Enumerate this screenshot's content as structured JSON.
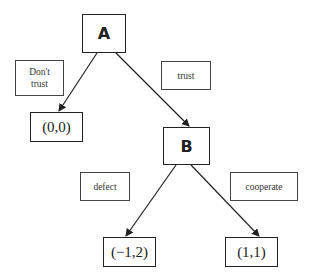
{
  "diagram": {
    "type": "game-tree",
    "nodes": {
      "A": {
        "label": "A"
      },
      "B": {
        "label": "B"
      }
    },
    "edge_labels": {
      "dont_trust": "Don't trust",
      "trust": "trust",
      "defect": "defect",
      "cooperate": "cooperate"
    },
    "payoffs": {
      "dont_trust": "(0,0)",
      "defect": "(−1,2)",
      "cooperate": "(1,1)"
    },
    "edges": [
      {
        "from": "A",
        "to": "(0,0)",
        "label": "Don't trust"
      },
      {
        "from": "A",
        "to": "B",
        "label": "trust"
      },
      {
        "from": "B",
        "to": "(−1,2)",
        "label": "defect"
      },
      {
        "from": "B",
        "to": "(1,1)",
        "label": "cooperate"
      }
    ]
  }
}
